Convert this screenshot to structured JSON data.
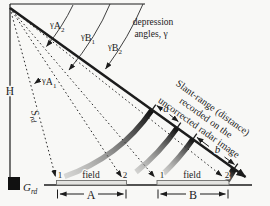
{
  "figure": {
    "type": "radar-slant-range-geometry-diagram",
    "labels": {
      "height": "H",
      "slant_line1": "Slant-range (distance)",
      "slant_line2": "recorded on the",
      "slant_line3": "uncorrected radar image",
      "depression_line1": "depression",
      "depression_line2": "angles, γ",
      "gamma": "γ",
      "srd_main": "S",
      "srd_sub": "rd",
      "grd_main": "G",
      "grd_sub": "rd",
      "seg_a": "a",
      "seg_b": "b"
    },
    "angle_labels": {
      "a1": {
        "letter": "A",
        "sub": "1"
      },
      "a2": {
        "letter": "A",
        "sub": "2"
      },
      "b1": {
        "letter": "B",
        "sub": "1"
      },
      "b2": {
        "letter": "B",
        "sub": "2"
      }
    },
    "fields": {
      "a": {
        "point1": "1",
        "point2": "2",
        "name": "field",
        "dim": "A"
      },
      "b": {
        "point1": "1",
        "point2": "2",
        "name": "field",
        "dim": "B"
      }
    },
    "colors": {
      "background": "#f8f8f6",
      "ink": "#1c1c1c",
      "swath_dark": "#0d0d0d",
      "swath_light": "#9a9a98",
      "field_fill": "#e4e4e1",
      "field_stroke": "#6f6f6d"
    }
  }
}
